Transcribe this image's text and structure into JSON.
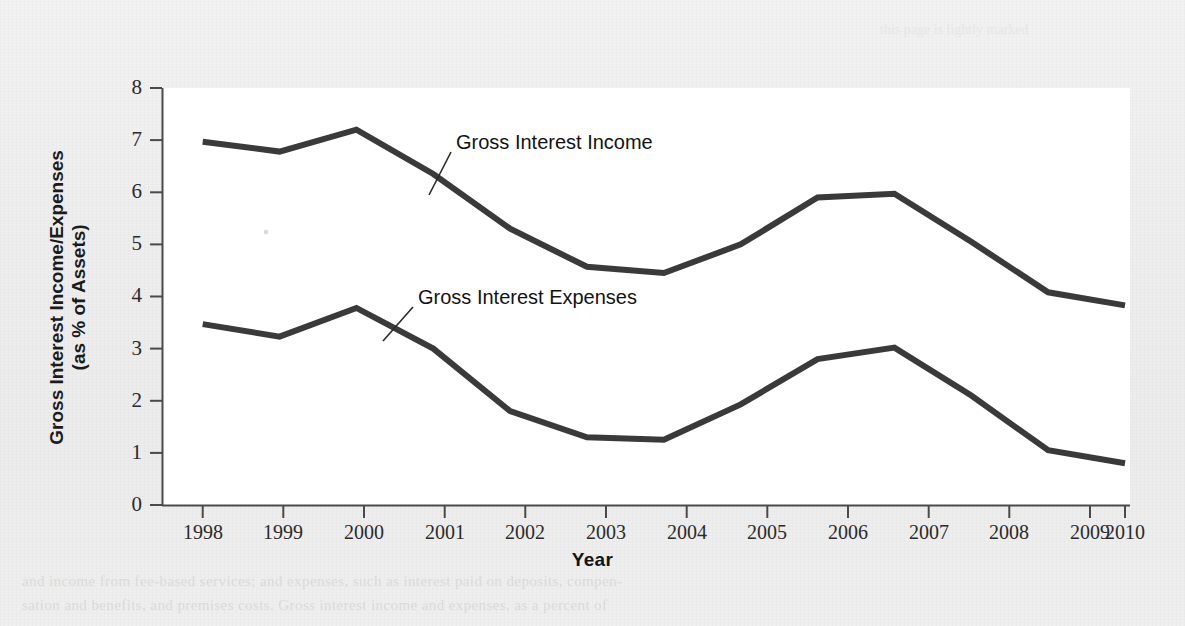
{
  "figure": {
    "plot_background": "#ffffff",
    "page_background": "#efefef",
    "line_color": "#3a3a3a",
    "axis_color": "#4a4a4a"
  },
  "axes": {
    "ylabel_line1": "Gross Interest Income/Expenses",
    "ylabel_line2": "(as % of Assets)",
    "xlabel": "Year",
    "yticks": [
      "8",
      "7",
      "6",
      "5",
      "4",
      "3",
      "2",
      "1",
      "0"
    ],
    "xticks": [
      "1998",
      "1999",
      "2000",
      "2001",
      "2002",
      "2003",
      "2004",
      "2005",
      "2006",
      "2007",
      "2008",
      "2009",
      "2010"
    ]
  },
  "annotations": {
    "income_label": "Gross Interest Income",
    "expenses_label": "Gross Interest Expenses"
  },
  "ghost": {
    "top_1": "this page is lightly marked",
    "bottom_1": "and income from fee-based services; and expenses, such as interest paid on deposits, compen-",
    "bottom_2": "sation and benefits, and premises costs. Gross interest income and expenses, as a percent of"
  },
  "chart_data": {
    "type": "line",
    "title": "",
    "xlabel": "Year",
    "ylabel": "Gross Interest Income/Expenses (as % of Assets)",
    "x": [
      1998,
      1999,
      2000,
      2001,
      2002,
      2003,
      2004,
      2005,
      2006,
      2007,
      2008,
      2009,
      2010
    ],
    "xlim": [
      1998,
      2010
    ],
    "ylim": [
      0,
      8
    ],
    "yticks": [
      0,
      1,
      2,
      3,
      4,
      5,
      6,
      7,
      8
    ],
    "grid": false,
    "legend": "inline-annotations",
    "series": [
      {
        "name": "Gross Interest Income",
        "values": [
          6.97,
          6.78,
          7.2,
          6.35,
          5.3,
          4.57,
          4.45,
          5.0,
          5.9,
          5.97,
          5.05,
          4.08,
          3.83
        ]
      },
      {
        "name": "Gross Interest Expenses",
        "values": [
          3.47,
          3.23,
          3.78,
          3.0,
          1.8,
          1.3,
          1.25,
          1.93,
          2.8,
          3.02,
          2.1,
          1.05,
          0.8
        ]
      }
    ]
  }
}
